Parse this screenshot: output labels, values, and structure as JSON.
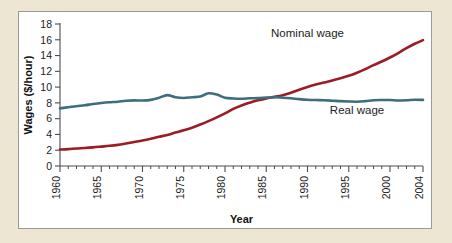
{
  "chart_data": {
    "type": "line",
    "title": "",
    "xlabel": "Year",
    "ylabel": "Wages ($/hour)",
    "xlim": [
      1960,
      2004
    ],
    "ylim": [
      0,
      18
    ],
    "ytick_step": 2,
    "xtick_step": 5,
    "grid": false,
    "legend": "inline-labels",
    "yticks": [
      0,
      2,
      4,
      6,
      8,
      10,
      12,
      14,
      16,
      18
    ],
    "ytick_labels": [
      "0",
      "2",
      "4",
      "6",
      "8",
      "10",
      "12",
      "14",
      "16",
      "18"
    ],
    "xticks": [
      1960,
      1965,
      1970,
      1975,
      1980,
      1985,
      1990,
      1995,
      2000,
      2004
    ],
    "xtick_labels": [
      "1960",
      "1965",
      "1970",
      "1975",
      "1980",
      "1985",
      "1990",
      "1995",
      "2000",
      "2004"
    ],
    "xtick_minor_step": 1,
    "x": [
      1960,
      1961,
      1962,
      1963,
      1964,
      1965,
      1966,
      1967,
      1968,
      1969,
      1970,
      1971,
      1972,
      1973,
      1974,
      1975,
      1976,
      1977,
      1978,
      1979,
      1980,
      1981,
      1982,
      1983,
      1984,
      1985,
      1986,
      1987,
      1988,
      1989,
      1990,
      1991,
      1992,
      1993,
      1994,
      1995,
      1996,
      1997,
      1998,
      1999,
      2000,
      2001,
      2002,
      2003,
      2004
    ],
    "series": [
      {
        "name": "Nominal wage",
        "color": "#9d1b24",
        "label": "Nominal wage",
        "values": [
          2.09,
          2.14,
          2.22,
          2.28,
          2.36,
          2.46,
          2.56,
          2.68,
          2.85,
          3.04,
          3.23,
          3.45,
          3.7,
          3.94,
          4.24,
          4.53,
          4.86,
          5.25,
          5.69,
          6.16,
          6.66,
          7.25,
          7.68,
          8.02,
          8.32,
          8.57,
          8.76,
          8.98,
          9.28,
          9.66,
          10.01,
          10.32,
          10.57,
          10.83,
          11.12,
          11.43,
          11.82,
          12.28,
          12.78,
          13.24,
          13.75,
          14.32,
          14.95,
          15.5,
          15.95
        ]
      },
      {
        "name": "Real wage",
        "color": "#3d6e7e",
        "label": "Real wage",
        "values": [
          7.3,
          7.45,
          7.58,
          7.7,
          7.85,
          7.98,
          8.08,
          8.15,
          8.28,
          8.32,
          8.3,
          8.38,
          8.65,
          8.98,
          8.72,
          8.62,
          8.72,
          8.8,
          9.22,
          9.05,
          8.65,
          8.56,
          8.53,
          8.58,
          8.6,
          8.67,
          8.72,
          8.66,
          8.58,
          8.48,
          8.4,
          8.36,
          8.33,
          8.28,
          8.22,
          8.18,
          8.15,
          8.22,
          8.33,
          8.36,
          8.36,
          8.3,
          8.33,
          8.4,
          8.38
        ]
      }
    ],
    "annotations": [
      {
        "text": "Nominal wage",
        "x": 1990,
        "y": 16.3
      },
      {
        "text": "Real wage",
        "x": 1996,
        "y": 6.6
      }
    ]
  }
}
